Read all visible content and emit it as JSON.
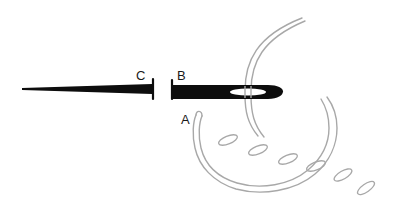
{
  "figure": {
    "background_color": "#ffffff",
    "width": 394,
    "height": 204
  },
  "colors": {
    "needle": "#0d0d0d",
    "thread": "#a8a8a8",
    "stitch": "#a8a8a8",
    "label": "#1a1a1a",
    "eye": "#ffffff"
  },
  "labels": {
    "a": "A",
    "b": "B",
    "c": "C"
  },
  "parts": {
    "needle_point_name": "needle point",
    "needle_shaft_name": "needle shaft",
    "needle_eye_name": "needle eye",
    "thread_name": "thread",
    "loop_name": "thread loop",
    "stitch_name": "stitch mark"
  },
  "stitches": [
    {
      "cx": 228,
      "cy": 140,
      "rx": 10,
      "ry": 4,
      "angle": -22
    },
    {
      "cx": 258,
      "cy": 150,
      "rx": 10,
      "ry": 4,
      "angle": -22
    },
    {
      "cx": 288,
      "cy": 159,
      "rx": 10,
      "ry": 4,
      "angle": -22
    },
    {
      "cx": 316,
      "cy": 166,
      "rx": 10,
      "ry": 4,
      "angle": -22
    },
    {
      "cx": 343,
      "cy": 175,
      "rx": 10,
      "ry": 4,
      "angle": -30
    },
    {
      "cx": 366,
      "cy": 188,
      "rx": 10,
      "ry": 4,
      "angle": -35
    }
  ]
}
